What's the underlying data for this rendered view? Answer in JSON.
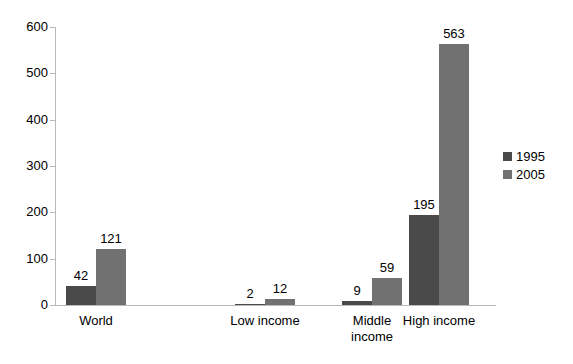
{
  "chart_data": {
    "type": "bar",
    "title": "",
    "subtitle": "",
    "xlabel": "",
    "ylabel": "",
    "categories": [
      "World",
      "Low income",
      "Middle income",
      "High income"
    ],
    "series": [
      {
        "name": "1995",
        "color": "#4a4a4a",
        "values": [
          42,
          2,
          9,
          195
        ]
      },
      {
        "name": "2005",
        "color": "#717171",
        "values": [
          121,
          12,
          59,
          563
        ]
      }
    ],
    "ylim": [
      0,
      600
    ],
    "yticks": [
      0,
      100,
      200,
      300,
      400,
      500,
      600
    ],
    "ytick_labels": [
      "0",
      "100",
      "200",
      "300",
      "400",
      "500",
      "600"
    ],
    "grid": false,
    "legend_position": "right",
    "data_labels": true,
    "axis_color": "#b9b9b9",
    "background": "#ffffff"
  },
  "legend": {
    "items": [
      {
        "label": "1995",
        "color": "#4a4a4a"
      },
      {
        "label": "2005",
        "color": "#717171"
      }
    ]
  },
  "axis": {
    "y_labels": [
      "600",
      "500",
      "400",
      "300",
      "200",
      "100",
      "0"
    ],
    "x_labels": [
      "World",
      "Low income",
      "Middle\nincome",
      "High income"
    ]
  },
  "values": {
    "world_1995": "42",
    "world_2005": "121",
    "low_1995": "2",
    "low_2005": "12",
    "middle_1995": "9",
    "middle_2005": "59",
    "high_1995": "195",
    "high_2005": "563"
  }
}
